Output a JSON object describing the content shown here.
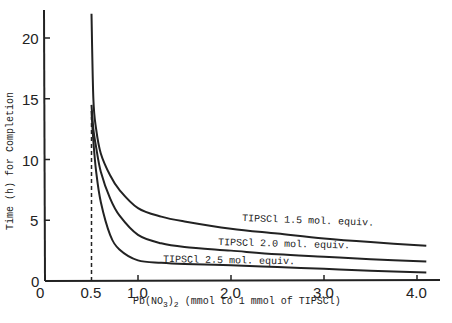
{
  "chart_data": {
    "type": "line",
    "title": "",
    "xlabel": "Pb(NO3)2 (mmol to 1 mmol of TIPSCl)",
    "ylabel": "Time (h) for Completion",
    "xlim": [
      0,
      4.2
    ],
    "ylim": [
      0,
      23
    ],
    "x_ticks": [
      "0",
      "0.5",
      "1.0",
      "2.0",
      "3.0",
      "4.0"
    ],
    "y_ticks": [
      "0",
      "5",
      "10",
      "15",
      "20"
    ],
    "grid": false,
    "annotations": [
      "dashed vertical line at x = 0.5"
    ],
    "series": [
      {
        "name": "TIPSCl 1.5 mol. equiv.",
        "x": [
          0.5,
          0.52,
          0.55,
          0.6,
          0.7,
          0.8,
          1.0,
          1.25,
          1.5,
          2.0,
          2.5,
          3.0,
          3.5,
          4.1
        ],
        "values": [
          22,
          15,
          12.5,
          10.5,
          8.7,
          7.5,
          6.0,
          5.3,
          4.9,
          4.3,
          3.9,
          3.5,
          3.2,
          2.9
        ]
      },
      {
        "name": "TIPSCl 2.0 mol. equiv.",
        "x": [
          0.5,
          0.52,
          0.55,
          0.6,
          0.7,
          0.8,
          1.0,
          1.25,
          1.5,
          2.0,
          2.5,
          3.0,
          3.5,
          4.1
        ],
        "values": [
          14.5,
          12.5,
          11,
          9,
          6.8,
          5.4,
          3.8,
          3.1,
          2.8,
          2.5,
          2.2,
          2.0,
          1.8,
          1.6
        ]
      },
      {
        "name": "TIPSCl 2.5 mol. equiv.",
        "x": [
          0.5,
          0.52,
          0.55,
          0.6,
          0.7,
          0.8,
          1.0,
          1.25,
          1.5,
          2.0,
          2.5,
          3.0,
          3.5,
          4.1
        ],
        "values": [
          14,
          11.5,
          9,
          6.5,
          3.8,
          2.6,
          1.7,
          1.5,
          1.4,
          1.3,
          1.15,
          1.0,
          0.85,
          0.7
        ]
      }
    ]
  },
  "labels": {
    "ylabel": "Time (h) for Completion",
    "xlabel_prefix": "Pb(NO",
    "xlabel_sub1": "3",
    "xlabel_mid": ")",
    "xlabel_sub2": "2",
    "xlabel_suffix": " (mmol to 1 mmol of TIPSCl)",
    "origin_y": "0",
    "origin_x": "0"
  }
}
